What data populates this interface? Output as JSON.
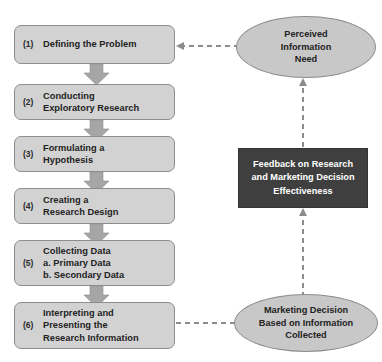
{
  "diagram": {
    "colors": {
      "box_fill": "#d2d2d2",
      "box_border": "#8c8c8c",
      "ellipse_fill": "#c8c8c8",
      "dark_box_fill": "#3f3f3f",
      "dark_box_text": "#ffffff",
      "arrow_fill": "#a6a6a6",
      "dashed_line": "#8c8c8c",
      "background": "#ffffff"
    },
    "steps": [
      {
        "number": "(1)",
        "label": "Defining the Problem"
      },
      {
        "number": "(2)",
        "label": "Conducting\nExploratory Research"
      },
      {
        "number": "(3)",
        "label": "Formulating a\nHypothesis"
      },
      {
        "number": "(4)",
        "label": "Creating a\nResearch Design"
      },
      {
        "number": "(5)",
        "label": "Collecting Data\na. Primary Data\nb. Secondary Data"
      },
      {
        "number": "(6)",
        "label": "Interpreting and\nPresenting the\nResearch Information"
      }
    ],
    "nodes": {
      "perceived_need": "Perceived\nInformation\nNeed",
      "feedback": "Feedback on Research\nand Marketing Decision\nEffectiveness",
      "marketing_decision": "Marketing Decision\nBased on Information\nCollected"
    },
    "connectors": {
      "step_arrows": [
        "arrow-step1-to-step2",
        "arrow-step2-to-step3",
        "arrow-step3-to-step4",
        "arrow-step4-to-step5",
        "arrow-step5-to-step6"
      ],
      "dashed": [
        "dashed-perceived-need-to-step1",
        "dashed-feedback-to-perceived-need",
        "dashed-marketing-decision-to-feedback",
        "dashed-step6-to-marketing-decision"
      ]
    }
  }
}
